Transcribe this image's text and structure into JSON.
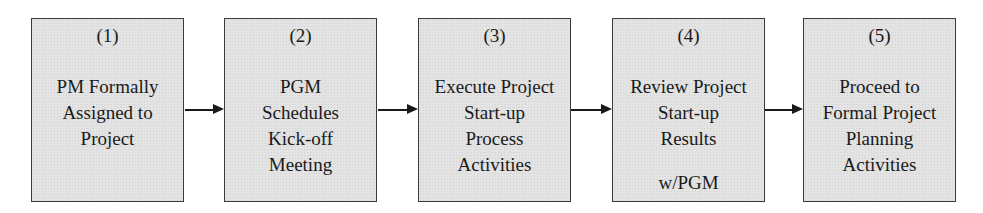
{
  "diagram": {
    "type": "flowchart",
    "direction": "left-to-right",
    "steps": [
      {
        "number": "(1)",
        "lines": [
          "PM Formally",
          "Assigned to",
          "Project"
        ],
        "footer": ""
      },
      {
        "number": "(2)",
        "lines": [
          "PGM",
          "Schedules",
          "Kick-off",
          "Meeting"
        ],
        "footer": ""
      },
      {
        "number": "(3)",
        "lines": [
          "Execute Project",
          "Start-up",
          "Process",
          "Activities"
        ],
        "footer": ""
      },
      {
        "number": "(4)",
        "lines": [
          "Review Project",
          "Start-up",
          "Results"
        ],
        "footer": "w/PGM"
      },
      {
        "number": "(5)",
        "lines": [
          "Proceed to",
          "Formal Project",
          "Planning",
          "Activities"
        ],
        "footer": ""
      }
    ],
    "connections": [
      {
        "from": 1,
        "to": 2
      },
      {
        "from": 2,
        "to": 3
      },
      {
        "from": 3,
        "to": 4
      },
      {
        "from": 4,
        "to": 5
      }
    ],
    "colors": {
      "box_fill": "#e3e3e3",
      "border": "#3a3a3a",
      "text": "#1a1a1a"
    }
  }
}
